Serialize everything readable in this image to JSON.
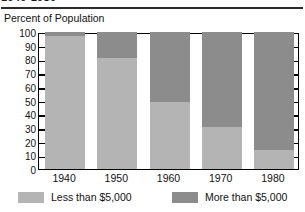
{
  "title": {
    "text": "1940-1980",
    "visible_note": "top edge cropped"
  },
  "axis_caption": "Percent of Population",
  "chart_data": {
    "type": "bar",
    "subtype": "stacked-100",
    "title": "1940-1980",
    "xlabel": "",
    "ylabel": "Percent of Population",
    "ylim": [
      0,
      100
    ],
    "yticks": [
      0,
      10,
      20,
      30,
      40,
      50,
      60,
      70,
      80,
      90,
      100
    ],
    "ytick_labels": [
      "0",
      "10",
      "20",
      "30",
      "40",
      "50",
      "60",
      "70",
      "80",
      "90",
      "100"
    ],
    "grid": false,
    "legend_position": "bottom",
    "categories": [
      "1940",
      "1950",
      "1960",
      "1970",
      "1980"
    ],
    "series": [
      {
        "name": "Less than $5,000",
        "color": "#b4b4b4",
        "values": [
          97,
          81,
          49,
          31,
          14
        ]
      },
      {
        "name": "More than $5,000",
        "color": "#8c8c8c",
        "values": [
          3,
          19,
          51,
          69,
          86
        ]
      }
    ]
  },
  "legend": {
    "items": [
      {
        "label": "Less than $5,000",
        "color": "#b4b4b4"
      },
      {
        "label": "More than $5,000",
        "color": "#8c8c8c"
      }
    ]
  },
  "colors": {
    "frame": "#000000",
    "text": "#111111",
    "background": "#ffffff",
    "series_low": "#b4b4b4",
    "series_high": "#8c8c8c"
  }
}
